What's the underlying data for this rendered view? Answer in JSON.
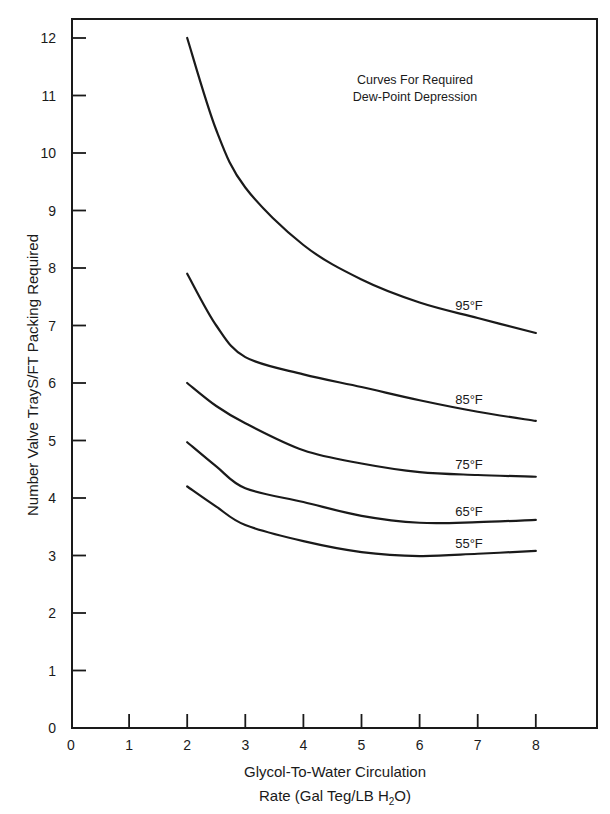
{
  "chart_data": {
    "type": "line",
    "title": "",
    "annotation": [
      "Curves For Required",
      "Dew-Point Depression"
    ],
    "xlabel": [
      "Glycol-To-Water Circulation",
      "Rate (Gal Teg/LB H",
      "2",
      "O)"
    ],
    "ylabel": "Number Valve TrayS/FT Packing Required",
    "xlim": [
      0,
      9
    ],
    "ylim": [
      0,
      12.3
    ],
    "xticks": [
      0,
      1,
      2,
      3,
      4,
      5,
      6,
      7,
      8
    ],
    "yticks": [
      0,
      1,
      2,
      3,
      4,
      5,
      6,
      7,
      8,
      9,
      10,
      11,
      12
    ],
    "grid": false,
    "legend": "inline curve labels",
    "x": [
      2,
      2.5,
      3,
      4,
      5,
      6,
      7,
      8
    ],
    "series": [
      {
        "name": "95°F",
        "label": "95°F",
        "label_x": 6.85,
        "label_dy": -6,
        "values": [
          12.0,
          10.4,
          9.4,
          8.4,
          7.8,
          7.4,
          7.13,
          6.87
        ]
      },
      {
        "name": "85°F",
        "label": "85°F",
        "label_x": 6.85,
        "label_dy": -6,
        "values": [
          7.9,
          7.0,
          6.45,
          6.15,
          5.93,
          5.7,
          5.5,
          5.34
        ]
      },
      {
        "name": "75°F",
        "label": "75°F",
        "label_x": 6.85,
        "label_dy": -6,
        "values": [
          6.0,
          5.6,
          5.3,
          4.83,
          4.6,
          4.45,
          4.4,
          4.37
        ]
      },
      {
        "name": "65°F",
        "label": "65°F",
        "label_x": 6.85,
        "label_dy": -6,
        "values": [
          4.97,
          4.55,
          4.17,
          3.93,
          3.69,
          3.57,
          3.58,
          3.62
        ]
      },
      {
        "name": "55°F",
        "label": "55°F",
        "label_x": 6.85,
        "label_dy": -6,
        "values": [
          4.2,
          3.85,
          3.53,
          3.25,
          3.06,
          2.99,
          3.03,
          3.08
        ]
      }
    ]
  },
  "colors": {
    "line": "#1a1a1a",
    "background": "#ffffff"
  }
}
